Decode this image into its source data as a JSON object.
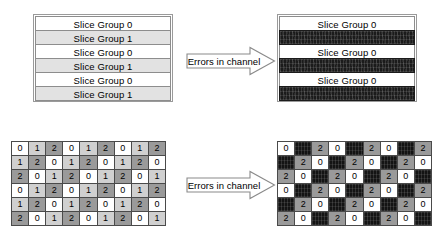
{
  "figure": {
    "colors": {
      "slice_group_0": "#ffffff",
      "slice_group_1": "#e2e2e2",
      "corrupted": "#1b1b1b",
      "mb_value_0": "#ffffff",
      "mb_value_1": "#d0d0d0",
      "mb_value_2": "#9a9a9a",
      "mb_lost": "#141414",
      "border": "#4a4a4a"
    }
  },
  "top_left_stack": {
    "name": "Interleaved slice groups before transmission",
    "rows": [
      {
        "label": "Slice Group 0",
        "group": 0,
        "state": "ok"
      },
      {
        "label": "Slice Group 1",
        "group": 1,
        "state": "ok"
      },
      {
        "label": "Slice Group 0",
        "group": 0,
        "state": "ok"
      },
      {
        "label": "Slice Group 1",
        "group": 1,
        "state": "ok"
      },
      {
        "label": "Slice Group 0",
        "group": 0,
        "state": "ok"
      },
      {
        "label": "Slice Group 1",
        "group": 1,
        "state": "ok"
      }
    ]
  },
  "top_right_stack": {
    "name": "Received slice groups after channel errors",
    "rows": [
      {
        "label": "Slice Group 0",
        "group": 0,
        "state": "ok"
      },
      {
        "label": "",
        "group": 1,
        "state": "corrupt"
      },
      {
        "label": "Slice Group 0",
        "group": 0,
        "state": "ok"
      },
      {
        "label": "",
        "group": 1,
        "state": "corrupt"
      },
      {
        "label": "Slice Group 0",
        "group": 0,
        "state": "ok"
      },
      {
        "label": "",
        "group": 1,
        "state": "corrupt"
      }
    ]
  },
  "top_arrow": {
    "label": "Errors in channel",
    "icon": "right-block-arrow-icon"
  },
  "bottom_arrow": {
    "label": "Errors in channel",
    "icon": "right-block-arrow-icon"
  },
  "bottom_left_grid": {
    "name": "Macroblock allocation map before transmission",
    "columns": 9,
    "rows_count": 6,
    "rows": [
      [
        0,
        1,
        2,
        0,
        1,
        2,
        0,
        1,
        2
      ],
      [
        1,
        2,
        0,
        1,
        2,
        0,
        1,
        2,
        0
      ],
      [
        2,
        0,
        1,
        2,
        0,
        1,
        2,
        0,
        1
      ],
      [
        0,
        1,
        2,
        0,
        1,
        2,
        0,
        1,
        2
      ],
      [
        1,
        2,
        0,
        1,
        2,
        0,
        1,
        2,
        0
      ],
      [
        2,
        0,
        1,
        2,
        0,
        1,
        2,
        0,
        1
      ]
    ]
  },
  "bottom_right_grid": {
    "name": "Macroblock allocation map after channel errors",
    "columns": 9,
    "rows_count": 6,
    "lost_value": 1,
    "rows": [
      [
        0,
        "X",
        2,
        0,
        "X",
        2,
        0,
        "X",
        2
      ],
      [
        "X",
        2,
        0,
        "X",
        2,
        0,
        "X",
        2,
        0
      ],
      [
        2,
        0,
        "X",
        2,
        0,
        "X",
        2,
        0,
        "X"
      ],
      [
        0,
        "X",
        2,
        0,
        "X",
        2,
        0,
        "X",
        2
      ],
      [
        "X",
        2,
        0,
        "X",
        2,
        0,
        "X",
        2,
        0
      ],
      [
        2,
        0,
        "X",
        2,
        0,
        "X",
        2,
        0,
        "X"
      ]
    ]
  }
}
